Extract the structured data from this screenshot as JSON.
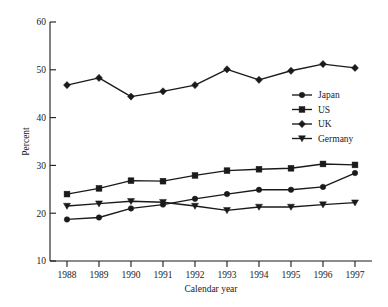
{
  "chart_data": {
    "type": "line",
    "title": "",
    "xlabel": "Calendar year",
    "ylabel": "Percent",
    "x": [
      1988,
      1989,
      1990,
      1991,
      1992,
      1993,
      1994,
      1995,
      1996,
      1997
    ],
    "xtick_labels": [
      "1988",
      "1989",
      "1990",
      "1991",
      "1992",
      "1993",
      "1994",
      "1995",
      "1996",
      "1997"
    ],
    "ytick_labels": [
      "10",
      "20",
      "30",
      "40",
      "50",
      "60"
    ],
    "yticks": [
      10,
      20,
      30,
      40,
      50,
      60
    ],
    "ylim": [
      10,
      60
    ],
    "xlim": [
      1988,
      1997
    ],
    "grid": false,
    "legend_position": "center-right",
    "series": [
      {
        "name": "Japan",
        "marker": "circle",
        "values": [
          18.7,
          19.1,
          21.0,
          21.8,
          23.0,
          24.0,
          24.9,
          24.9,
          25.5,
          28.4
        ]
      },
      {
        "name": "US",
        "marker": "square",
        "values": [
          24.0,
          25.2,
          26.8,
          26.7,
          27.9,
          28.9,
          29.2,
          29.4,
          30.3,
          30.1
        ]
      },
      {
        "name": "UK",
        "marker": "diamond",
        "values": [
          46.8,
          48.3,
          44.4,
          45.5,
          46.8,
          50.1,
          47.9,
          49.8,
          51.2,
          50.4
        ]
      },
      {
        "name": "Germany",
        "marker": "triangle-down",
        "values": [
          21.5,
          22.0,
          22.5,
          22.3,
          21.5,
          20.6,
          21.3,
          21.3,
          21.8,
          22.2
        ]
      }
    ],
    "colors": {
      "ink": "#1a1a1a",
      "background": "#ffffff"
    }
  }
}
